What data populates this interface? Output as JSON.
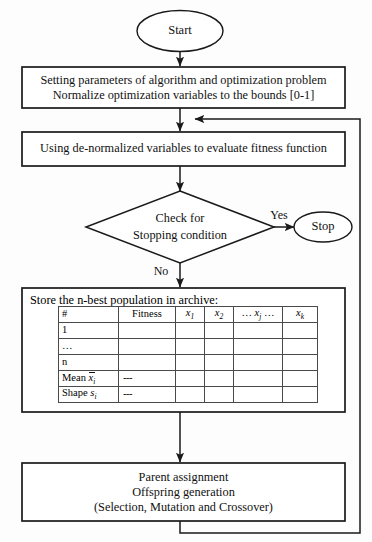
{
  "diagram": {
    "type": "flowchart",
    "stroke_color": "#1a1a1a",
    "background_color": "#fdfdfd"
  },
  "nodes": {
    "start": {
      "shape": "ellipse",
      "label": "Start"
    },
    "setup": {
      "shape": "process",
      "line1": "Setting parameters of algorithm and optimization problem",
      "line2": "Normalize optimization variables to the bounds [0-1]"
    },
    "evaluate": {
      "shape": "process",
      "line1": "Using de-normalized variables to evaluate fitness function"
    },
    "decision": {
      "shape": "diamond",
      "line1": "Check for",
      "line2": "Stopping condition"
    },
    "stop": {
      "shape": "ellipse",
      "label": "Stop"
    },
    "archive": {
      "shape": "process",
      "caption": "Store the n-best population in archive:"
    },
    "reproduce": {
      "shape": "process",
      "line1": "Parent assignment",
      "line2": "Offspring generation",
      "line3": "(Selection, Mutation and Crossover)"
    }
  },
  "edges": {
    "yes_label": "Yes",
    "no_label": "No"
  },
  "archive_table": {
    "columns": [
      "#",
      "Fitness",
      "x1",
      "x2",
      "... xj ...",
      "xk"
    ],
    "column_display": {
      "index": "#",
      "fitness": "Fitness",
      "x1_base": "x",
      "x1_sub": "1",
      "x2_base": "x",
      "x2_sub": "2",
      "xj_prefix": "…",
      "xj_base": "x",
      "xj_sub": "j",
      "xj_suffix": "…",
      "xk_base": "x",
      "xk_sub": "k"
    },
    "rows": [
      {
        "label": "1",
        "fitness": "",
        "x1": "",
        "x2": "",
        "xj": "",
        "xk": ""
      },
      {
        "label": "…",
        "fitness": "",
        "x1": "",
        "x2": "",
        "xj": "",
        "xk": ""
      },
      {
        "label": "n",
        "fitness": "",
        "x1": "",
        "x2": "",
        "xj": "",
        "xk": ""
      },
      {
        "label_base": "Mean",
        "label_sym": "x",
        "label_sub": "i",
        "overbar": true,
        "fitness": "---",
        "x1": "",
        "x2": "",
        "xj": "",
        "xk": ""
      },
      {
        "label_base": "Shape",
        "label_sym": "s",
        "label_sub": "i",
        "overbar": false,
        "fitness": "---",
        "x1": "",
        "x2": "",
        "xj": "",
        "xk": ""
      }
    ]
  }
}
